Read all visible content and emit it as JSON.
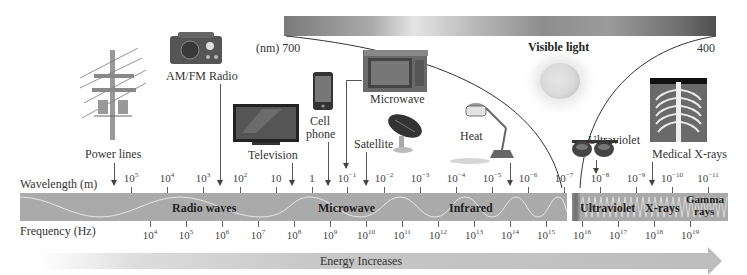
{
  "visible_light": {
    "title": "Visible light",
    "left_label": "(nm) 700",
    "right_label": "400"
  },
  "axes": {
    "wavelength_label": "Wavelength (m)",
    "frequency_label": "Frequency (Hz)"
  },
  "regions": [
    {
      "name": "Radio waves"
    },
    {
      "name": "Microwave"
    },
    {
      "name": "Infrared"
    },
    {
      "name": "Ultraviolet"
    },
    {
      "name": "X-rays"
    },
    {
      "name": "Gamma",
      "name2": "rays"
    }
  ],
  "wavelength_ticks": [
    {
      "base": "10",
      "exp": "5"
    },
    {
      "base": "10",
      "exp": "4"
    },
    {
      "base": "10",
      "exp": "3"
    },
    {
      "base": "10",
      "exp": "2"
    },
    {
      "base": "10",
      "exp": ""
    },
    {
      "base": "1",
      "exp": ""
    },
    {
      "base": "10",
      "exp": "−1"
    },
    {
      "base": "10",
      "exp": "−2"
    },
    {
      "base": "10",
      "exp": "−3"
    },
    {
      "base": "10",
      "exp": "−4"
    },
    {
      "base": "10",
      "exp": "−5"
    },
    {
      "base": "10",
      "exp": "−6"
    },
    {
      "base": "10",
      "exp": "−7"
    },
    {
      "base": "10",
      "exp": "−8"
    },
    {
      "base": "10",
      "exp": "−9"
    },
    {
      "base": "10",
      "exp": "−10"
    },
    {
      "base": "10",
      "exp": "−11"
    }
  ],
  "frequency_ticks": [
    {
      "base": "10",
      "exp": "4"
    },
    {
      "base": "10",
      "exp": "5"
    },
    {
      "base": "10",
      "exp": "6"
    },
    {
      "base": "10",
      "exp": "7"
    },
    {
      "base": "10",
      "exp": "8"
    },
    {
      "base": "10",
      "exp": "9"
    },
    {
      "base": "10",
      "exp": "10"
    },
    {
      "base": "10",
      "exp": "11"
    },
    {
      "base": "10",
      "exp": "12"
    },
    {
      "base": "10",
      "exp": "13"
    },
    {
      "base": "10",
      "exp": "14"
    },
    {
      "base": "10",
      "exp": "15"
    },
    {
      "base": "10",
      "exp": "16"
    },
    {
      "base": "10",
      "exp": "17"
    },
    {
      "base": "10",
      "exp": "18"
    },
    {
      "base": "10",
      "exp": "19"
    }
  ],
  "sources": {
    "power_lines": "Power lines",
    "radio": "AM/FM Radio",
    "television": "Television",
    "cell_phone_1": "Cell",
    "cell_phone_2": "phone",
    "microwave": "Microwave",
    "satellite": "Satellite",
    "heat": "Heat",
    "ultraviolet": "Ultraviolet",
    "medical_xrays": "Medical X-rays"
  },
  "energy": {
    "label": "Energy Increases"
  },
  "colors": {
    "band": "#aaaaaa",
    "text": "#333333",
    "visible_gradient_dark": "#4f4f4f",
    "visible_gradient_light": "#e4e4e4"
  }
}
